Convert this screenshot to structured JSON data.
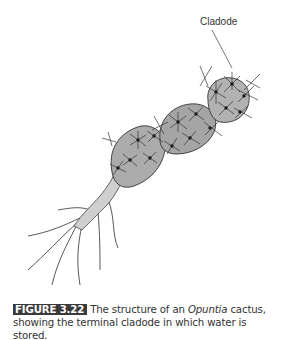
{
  "figure": {
    "callout_label": "Cladode",
    "caption": {
      "label": "FIGURE 3.22",
      "text_before": "The structure of an ",
      "italic": "Opuntia",
      "text_after": " cactus, showing the terminal cladode in which water is stored."
    },
    "colors": {
      "cladode_fill": "#a8a8a8",
      "stem_fill": "#c8c8c8",
      "root_fill": "#e4e4e4",
      "outline": "#333333",
      "label_bg": "#3a3a3a"
    }
  }
}
